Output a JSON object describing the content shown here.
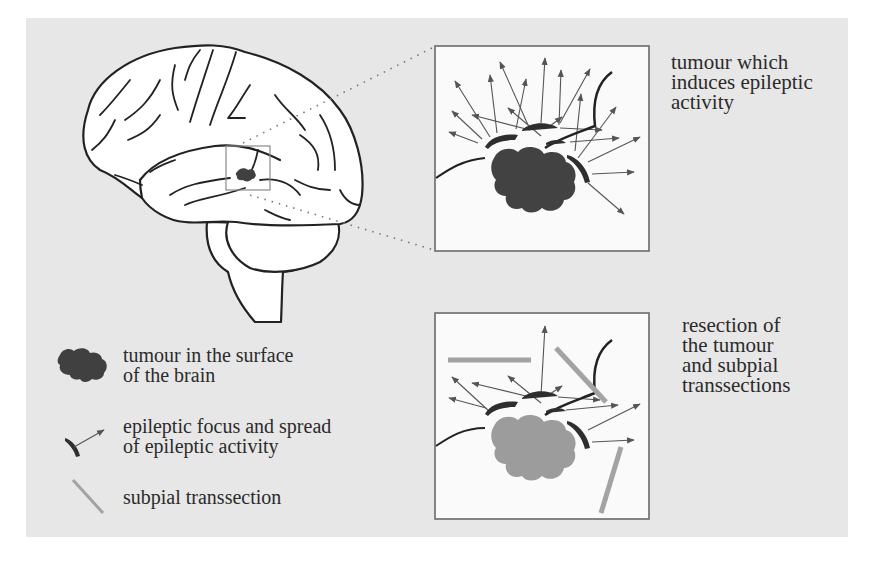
{
  "figure": {
    "background_color": "#e7e7e7",
    "brain_fill": "#ffffff",
    "outline_color": "#222222",
    "tumour_color": "#404040",
    "resected_tumour_color": "#9a9a9a",
    "transection_color": "#a3a3a3",
    "focus_color": "#2e2e2e",
    "arrow_color": "#555555"
  },
  "panels": {
    "upper": {
      "caption": "tumour which\ninduces epileptic\nactivity"
    },
    "lower": {
      "caption": "resection of\nthe tumour\nand subpial\ntranssections"
    }
  },
  "legend": {
    "items": [
      {
        "icon": "tumour-blob-icon",
        "label": "tumour in the surface\n of the brain"
      },
      {
        "icon": "epileptic-focus-arrow-icon",
        "label": "epileptic focus and spread\nof epileptic activity"
      },
      {
        "icon": "subpial-transection-line-icon",
        "label": "subpial transsection"
      }
    ]
  }
}
